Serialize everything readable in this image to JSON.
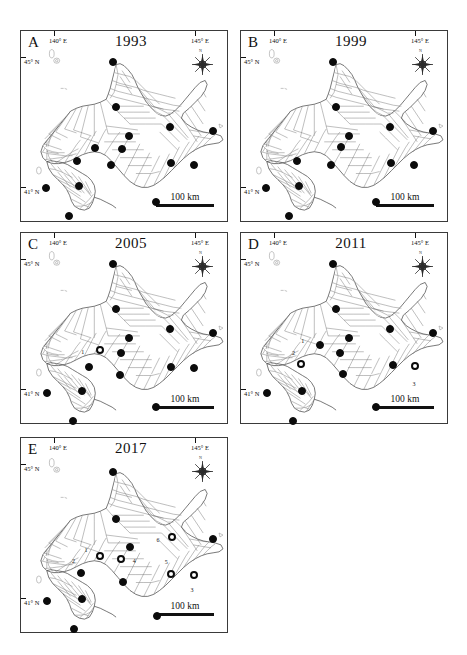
{
  "figure": {
    "region": "Hokkaido",
    "panel_count": 5
  },
  "common": {
    "lon_left_label": "140° E",
    "lon_right_label": "145° E",
    "lat_top_label": "45°  N",
    "lat_bottom_label": "41°   N",
    "scalebar_label": "100 km",
    "compass_north": "N",
    "marker_filled_name": "filled-circle-site",
    "marker_open_name": "open-circle-site"
  },
  "panels": [
    {
      "letter": "A",
      "year": "1993",
      "markers": [
        {
          "x": 44.5,
          "y": 16.5,
          "type": "filled"
        },
        {
          "x": 46.0,
          "y": 40.0,
          "type": "filled"
        },
        {
          "x": 72.5,
          "y": 50.5,
          "type": "filled"
        },
        {
          "x": 52.5,
          "y": 55.0,
          "type": "filled"
        },
        {
          "x": 93.0,
          "y": 52.5,
          "type": "filled"
        },
        {
          "x": 36.0,
          "y": 61.5,
          "type": "filled"
        },
        {
          "x": 49.0,
          "y": 62.0,
          "type": "filled"
        },
        {
          "x": 27.0,
          "y": 68.5,
          "type": "filled"
        },
        {
          "x": 43.5,
          "y": 70.5,
          "type": "filled"
        },
        {
          "x": 73.0,
          "y": 69.5,
          "type": "filled"
        },
        {
          "x": 84.0,
          "y": 70.5,
          "type": "filled"
        },
        {
          "x": 12.0,
          "y": 82.5,
          "type": "filled"
        },
        {
          "x": 28.0,
          "y": 81.5,
          "type": "filled"
        },
        {
          "x": 65.5,
          "y": 90.0,
          "type": "filled"
        },
        {
          "x": 23.5,
          "y": 97.5,
          "type": "filled"
        }
      ]
    },
    {
      "letter": "B",
      "year": "1999",
      "markers": [
        {
          "x": 44.5,
          "y": 16.5,
          "type": "filled"
        },
        {
          "x": 46.0,
          "y": 40.0,
          "type": "filled"
        },
        {
          "x": 72.5,
          "y": 50.5,
          "type": "filled"
        },
        {
          "x": 52.5,
          "y": 55.0,
          "type": "filled"
        },
        {
          "x": 93.0,
          "y": 52.5,
          "type": "filled"
        },
        {
          "x": 48.5,
          "y": 61.0,
          "type": "filled"
        },
        {
          "x": 27.0,
          "y": 68.5,
          "type": "filled"
        },
        {
          "x": 43.5,
          "y": 70.5,
          "type": "filled"
        },
        {
          "x": 73.0,
          "y": 69.5,
          "type": "filled"
        },
        {
          "x": 84.0,
          "y": 70.5,
          "type": "filled"
        },
        {
          "x": 12.0,
          "y": 82.5,
          "type": "filled"
        },
        {
          "x": 28.0,
          "y": 81.5,
          "type": "filled"
        },
        {
          "x": 65.5,
          "y": 90.0,
          "type": "filled"
        },
        {
          "x": 23.5,
          "y": 97.5,
          "type": "filled"
        }
      ]
    },
    {
      "letter": "C",
      "year": "2005",
      "markers": [
        {
          "x": 44.5,
          "y": 16.5,
          "type": "filled"
        },
        {
          "x": 46.0,
          "y": 40.0,
          "type": "filled"
        },
        {
          "x": 72.5,
          "y": 50.5,
          "type": "filled"
        },
        {
          "x": 52.5,
          "y": 55.0,
          "type": "filled"
        },
        {
          "x": 93.0,
          "y": 52.5,
          "type": "filled"
        },
        {
          "x": 38.5,
          "y": 61.5,
          "type": "open",
          "label": "1",
          "lx": 30.0,
          "ly": 62.5
        },
        {
          "x": 48.5,
          "y": 63.0,
          "type": "filled"
        },
        {
          "x": 33.0,
          "y": 70.5,
          "type": "filled"
        },
        {
          "x": 48.0,
          "y": 74.5,
          "type": "filled"
        },
        {
          "x": 73.0,
          "y": 70.5,
          "type": "filled"
        },
        {
          "x": 84.0,
          "y": 71.0,
          "type": "filled"
        },
        {
          "x": 12.5,
          "y": 84.0,
          "type": "filled"
        },
        {
          "x": 29.5,
          "y": 83.0,
          "type": "filled"
        },
        {
          "x": 65.5,
          "y": 91.5,
          "type": "filled"
        },
        {
          "x": 25.0,
          "y": 99.0,
          "type": "filled"
        }
      ]
    },
    {
      "letter": "D",
      "year": "2011",
      "markers": [
        {
          "x": 44.5,
          "y": 16.5,
          "type": "filled"
        },
        {
          "x": 46.0,
          "y": 40.0,
          "type": "filled"
        },
        {
          "x": 72.5,
          "y": 50.5,
          "type": "filled"
        },
        {
          "x": 52.5,
          "y": 55.0,
          "type": "filled"
        },
        {
          "x": 93.0,
          "y": 52.5,
          "type": "filled"
        },
        {
          "x": 38.5,
          "y": 59.0,
          "type": "filled",
          "label": "1",
          "lx": 30.0,
          "ly": 57.0
        },
        {
          "x": 48.0,
          "y": 63.0,
          "type": "filled"
        },
        {
          "x": 29.0,
          "y": 69.0,
          "type": "open",
          "label": "2",
          "lx": 25.5,
          "ly": 63.0
        },
        {
          "x": 49.5,
          "y": 74.0,
          "type": "filled"
        },
        {
          "x": 74.0,
          "y": 69.5,
          "type": "filled"
        },
        {
          "x": 84.5,
          "y": 70.0,
          "type": "open",
          "label": "3",
          "lx": 84.0,
          "ly": 79.5
        },
        {
          "x": 12.5,
          "y": 84.0,
          "type": "filled"
        },
        {
          "x": 29.5,
          "y": 83.0,
          "type": "filled"
        },
        {
          "x": 65.5,
          "y": 91.5,
          "type": "filled"
        },
        {
          "x": 25.0,
          "y": 99.0,
          "type": "filled"
        }
      ]
    },
    {
      "letter": "E",
      "year": "2017",
      "markers": [
        {
          "x": 44.5,
          "y": 17.5,
          "type": "filled"
        },
        {
          "x": 46.0,
          "y": 41.5,
          "type": "filled"
        },
        {
          "x": 73.5,
          "y": 51.0,
          "type": "open",
          "label": "6",
          "lx": 66.5,
          "ly": 52.5
        },
        {
          "x": 53.0,
          "y": 56.0,
          "type": "filled"
        },
        {
          "x": 93.0,
          "y": 52.0,
          "type": "filled"
        },
        {
          "x": 38.5,
          "y": 61.0,
          "type": "open",
          "label": "1",
          "lx": 31.5,
          "ly": 57.5
        },
        {
          "x": 48.5,
          "y": 62.5,
          "type": "open",
          "label": "4",
          "lx": 55.0,
          "ly": 63.5
        },
        {
          "x": 29.0,
          "y": 69.5,
          "type": "filled",
          "label": "2",
          "lx": 25.5,
          "ly": 63.5
        },
        {
          "x": 49.5,
          "y": 74.0,
          "type": "filled"
        },
        {
          "x": 73.0,
          "y": 70.0,
          "type": "open",
          "label": "5",
          "lx": 70.5,
          "ly": 64.0
        },
        {
          "x": 84.0,
          "y": 70.5,
          "type": "open",
          "label": "3",
          "lx": 83.0,
          "ly": 78.5
        },
        {
          "x": 12.5,
          "y": 84.0,
          "type": "filled"
        },
        {
          "x": 29.5,
          "y": 83.0,
          "type": "filled"
        },
        {
          "x": 66.0,
          "y": 91.5,
          "type": "filled"
        },
        {
          "x": 25.5,
          "y": 98.5,
          "type": "filled"
        }
      ]
    }
  ]
}
